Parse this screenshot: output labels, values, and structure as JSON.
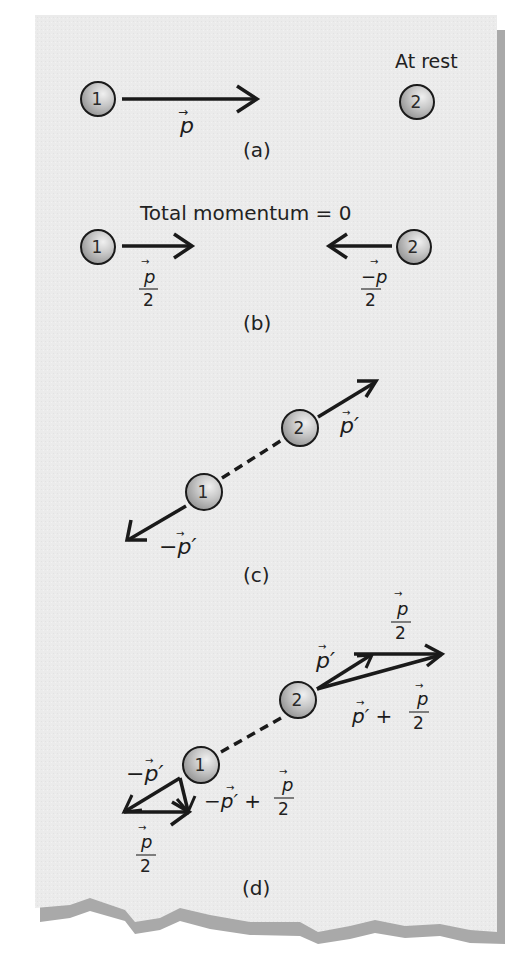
{
  "colors": {
    "paper": "#ececec",
    "shadow": "#a8a8a8",
    "ink": "#1a1a1a",
    "ball_fill": "#c4c4c4",
    "ball_highlight": "#e8e8e8"
  },
  "panels": {
    "a": {
      "caption": "(a)",
      "ball1_label": "1",
      "ball2_label": "2",
      "ball2_status": "At rest",
      "vector_label": "p",
      "vector_arrow": "→"
    },
    "b": {
      "caption": "(b)",
      "title": "Total momentum = 0",
      "ball1_label": "1",
      "ball2_label": "2",
      "left_vector": {
        "numerator": "p",
        "denominator": "2"
      },
      "right_vector": {
        "numerator": "−p",
        "denominator": "2"
      }
    },
    "c": {
      "caption": "(c)",
      "ball1_label": "1",
      "ball2_label": "2",
      "ball2_vector": "p′",
      "ball1_vector": "−p′"
    },
    "d": {
      "caption": "(d)",
      "ball1_label": "1",
      "ball2_label": "2",
      "ball2_vector": "p′",
      "ball2_half": {
        "numerator": "p",
        "denominator": "2"
      },
      "ball2_sum": {
        "prefix": "p′ +",
        "numerator": "p",
        "denominator": "2"
      },
      "ball1_vector": "−p′",
      "ball1_half": {
        "numerator": "p",
        "denominator": "2"
      },
      "ball1_sum": {
        "prefix": "−p′ +",
        "numerator": "p",
        "denominator": "2"
      }
    }
  }
}
